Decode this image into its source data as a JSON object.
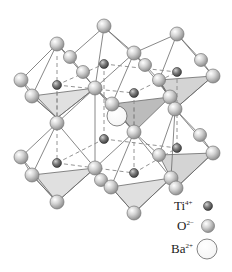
{
  "figure": {
    "colors": {
      "face_light": "#e2e2e2",
      "face_dark": "#b9b9b9",
      "edge": "#6a6a6a",
      "dash": "#888888",
      "o_fill": "#c9c9c9",
      "ti_fill": "#7a7a7a",
      "ba_fill": "#ffffff"
    }
  },
  "legend": {
    "items": [
      {
        "label": "Ti",
        "charge": "4+",
        "ion": "titanium-ion",
        "radius": 4.5
      },
      {
        "label": "O",
        "charge": "2−",
        "ion": "oxygen-ion",
        "radius": 6.5
      },
      {
        "label": "Ba",
        "charge": "2+",
        "ion": "barium-ion",
        "radius": 10
      }
    ]
  }
}
